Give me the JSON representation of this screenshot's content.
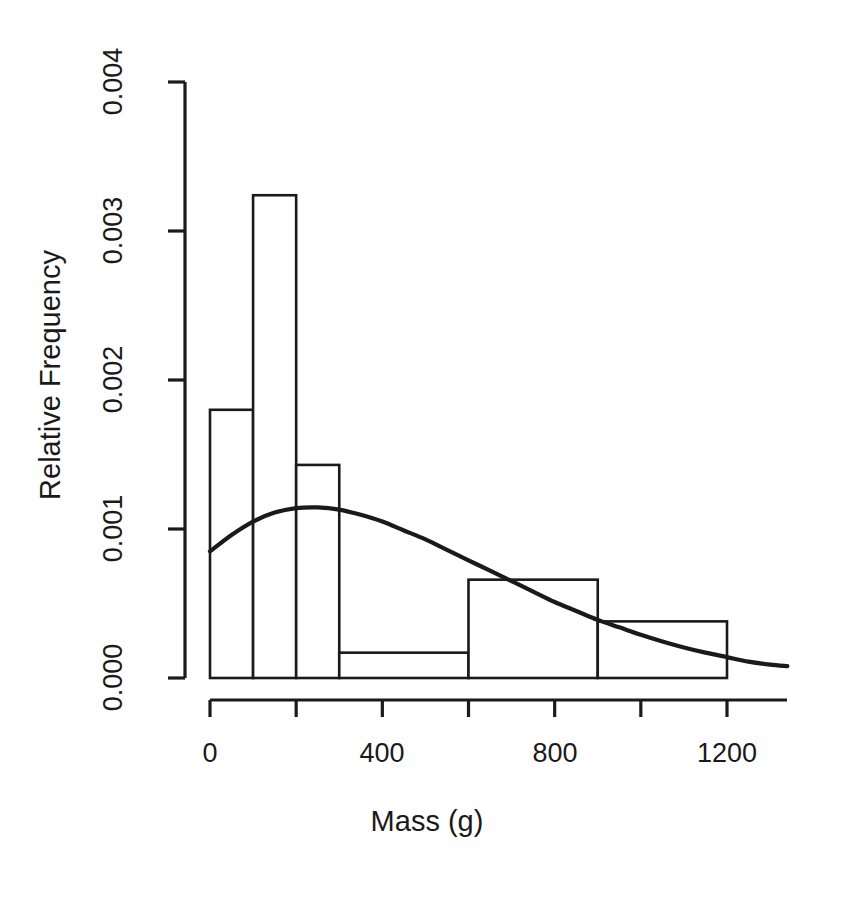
{
  "chart_data": {
    "type": "bar",
    "title": "",
    "subtitle": "",
    "xlabel": "Mass (g)",
    "ylabel": "Relative Frequency",
    "xlim": [
      0,
      1340
    ],
    "ylim": [
      0.0,
      0.004
    ],
    "grid": false,
    "legend": null,
    "xticks": [
      0,
      200,
      400,
      600,
      800,
      1000,
      1200
    ],
    "xticklabels": [
      "0",
      "",
      "400",
      "",
      "800",
      "",
      "1200"
    ],
    "yticks": [
      0.0,
      0.001,
      0.002,
      0.003,
      0.004
    ],
    "yticklabels": [
      "0.000",
      "0.001",
      "0.002",
      "0.003",
      "0.004"
    ],
    "bins": [
      {
        "x0": 0,
        "x1": 100,
        "density": 0.0018
      },
      {
        "x0": 100,
        "x1": 200,
        "density": 0.00324
      },
      {
        "x0": 200,
        "x1": 300,
        "density": 0.00143
      },
      {
        "x0": 300,
        "x1": 600,
        "density": 0.00017
      },
      {
        "x0": 600,
        "x1": 900,
        "density": 0.00066
      },
      {
        "x0": 900,
        "x1": 1200,
        "density": 0.00038
      }
    ],
    "series": [
      {
        "name": "density-curve",
        "type": "line",
        "x": [
          0,
          50,
          100,
          150,
          200,
          250,
          300,
          350,
          400,
          450,
          500,
          550,
          600,
          650,
          700,
          750,
          800,
          850,
          900,
          950,
          1000,
          1050,
          1100,
          1150,
          1200,
          1250,
          1300,
          1340
        ],
        "y": [
          0.00085,
          0.00096,
          0.00105,
          0.00111,
          0.00114,
          0.001145,
          0.00113,
          0.001095,
          0.00105,
          0.00099,
          0.00093,
          0.00086,
          0.00079,
          0.00072,
          0.00065,
          0.00058,
          0.00051,
          0.00045,
          0.00039,
          0.00034,
          0.00029,
          0.000245,
          0.000205,
          0.00017,
          0.00014,
          0.00011,
          9e-05,
          8e-05
        ]
      }
    ],
    "axis_color": "#1a1a1a",
    "bar_edge_color": "#1a1a1a",
    "bar_fill_color": "#ffffff",
    "curve_color": "#1a1a1a"
  },
  "axes": {
    "y_ticks": [
      {
        "label": "0.000",
        "top": 678
      },
      {
        "label": "0.001",
        "top": 529
      },
      {
        "label": "0.002",
        "top": 380
      },
      {
        "label": "0.003",
        "top": 231
      },
      {
        "label": "0.004",
        "top": 82
      }
    ],
    "x_ticks": [
      {
        "label": "0",
        "left": 210
      },
      {
        "label": "400",
        "left": 382
      },
      {
        "label": "800",
        "left": 555
      },
      {
        "label": "1200",
        "left": 727
      }
    ]
  }
}
